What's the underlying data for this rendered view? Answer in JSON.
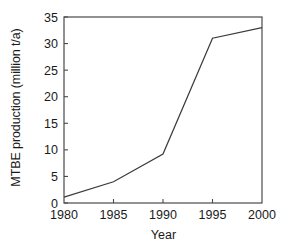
{
  "chart_data": {
    "type": "line",
    "title": "",
    "xlabel": "Year",
    "ylabel": "MTBE production (million t/a)",
    "x": [
      1980,
      1985,
      1990,
      1995,
      2000
    ],
    "values": [
      1.1,
      4.0,
      9.2,
      31.0,
      33.0
    ],
    "series": [
      {
        "name": "MTBE production",
        "values": [
          1.1,
          4.0,
          9.2,
          31.0,
          33.0
        ]
      }
    ],
    "xlim": [
      1980,
      2000
    ],
    "ylim": [
      0,
      35
    ],
    "xticks": [
      1980,
      1985,
      1990,
      1995,
      2000
    ],
    "yticks": [
      0,
      5,
      10,
      15,
      20,
      25,
      30,
      35
    ],
    "xtick_labels": [
      "1980",
      "1985",
      "1990",
      "1995",
      "2000"
    ],
    "ytick_labels": [
      "0",
      "5",
      "10",
      "15",
      "20",
      "25",
      "30",
      "35"
    ],
    "grid": false,
    "legend": false,
    "legend_position": "none",
    "markers": false,
    "line_color": "#3c3c3c",
    "axis_color": "#4a4a4a",
    "text_color": "#1a1a1a",
    "background_color": "#ffffff"
  }
}
